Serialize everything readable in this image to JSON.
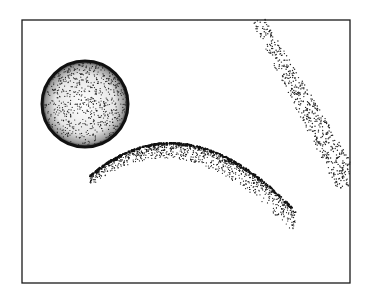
{
  "figure": {
    "frame": {
      "x": 22,
      "y": 20,
      "width": 328,
      "height": 263,
      "stroke": "#1a1a1a"
    },
    "sphere": {
      "cx": 85,
      "cy": 104,
      "r": 44,
      "color": "#111111"
    },
    "arc": {
      "start": [
        90,
        176
      ],
      "control": [
        185,
        95
      ],
      "end": [
        296,
        212
      ],
      "color": "#111111"
    },
    "band": {
      "start": [
        258,
        20
      ],
      "end": [
        350,
        185
      ],
      "width": 22,
      "color": "#222222"
    }
  }
}
